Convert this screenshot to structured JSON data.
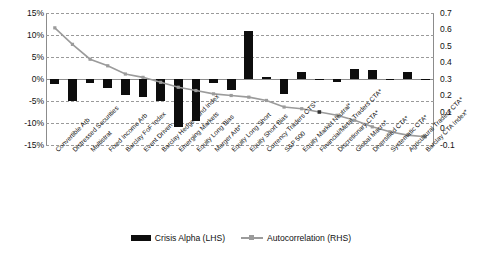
{
  "chart_data": {
    "type": "bar",
    "title": "",
    "subtitle": "",
    "xlabel": "",
    "ylabel": "",
    "y2label": "",
    "grid": true,
    "legend_position": "bottom",
    "categories": [
      "Convertible Arb",
      "Distressed Securities",
      "Multistrat",
      "Fixed Income Arb",
      "Barclay FoF Index",
      "Event Driven",
      "Barclay Hedge Fund Index",
      "Emerging Markets",
      "Equity Long Bias",
      "Merger Arb*",
      "Equity Long Short",
      "Equity Short Bias",
      "Currency Traders CTS*",
      "S&P 500",
      "Equity Market Neutral*",
      "Financial/Metal Traders CTA*",
      "Discretionary CTA*",
      "Global Macro*",
      "Diversified CTA*",
      "Systematic CTA*",
      "Agricultural Traders CTA*",
      "Barclay CTA Index*"
    ],
    "series": [
      {
        "name": "Crisis Alpha (LHS)",
        "axis": "left",
        "type": "bar",
        "color": "#0d0d0d",
        "values": [
          -1.2,
          -5.0,
          -0.9,
          -2.0,
          -3.6,
          -4.2,
          -4.9,
          -11.0,
          -9.6,
          -1.0,
          -2.5,
          11.0,
          0.4,
          -3.4,
          1.6,
          0.1,
          -0.6,
          2.2,
          2.0,
          0.0,
          1.7,
          0.0
        ]
      },
      {
        "name": "Autocorrelation (RHS)",
        "axis": "right",
        "type": "line",
        "color": "#9b9b9b",
        "values": [
          0.61,
          0.51,
          0.42,
          0.38,
          0.33,
          0.31,
          0.28,
          0.25,
          0.23,
          0.21,
          0.2,
          0.19,
          0.17,
          0.13,
          0.12,
          0.1,
          0.08,
          0.05,
          0.01,
          -0.02,
          -0.04,
          -0.05
        ]
      }
    ],
    "y_left": {
      "min": -15,
      "max": 15,
      "step": 5,
      "ticks": [
        "15%",
        "10%",
        "5%",
        "0%",
        "-5%",
        "-10%",
        "-15%"
      ]
    },
    "y_right": {
      "min": -0.1,
      "max": 0.7,
      "step": 0.1,
      "ticks": [
        "0.7",
        "0.6",
        "0.5",
        "0.4",
        "0.3",
        "0.2",
        "0.1",
        "0",
        "-0.1"
      ]
    },
    "legend": [
      {
        "label": "Crisis Alpha (LHS)",
        "marker": "bar",
        "color": "#0d0d0d"
      },
      {
        "label": "Autocorrelation (RHS)",
        "marker": "line",
        "color": "#9b9b9b"
      }
    ]
  }
}
